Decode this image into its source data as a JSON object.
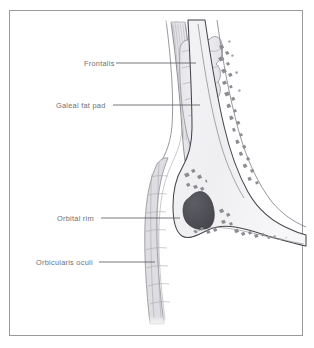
{
  "figure": {
    "kind": "anatomical-illustration",
    "view": "sagittal cross-section of brow and orbital rim",
    "border_color": "#9a9a9e",
    "background_color": "#ffffff"
  },
  "labels": [
    {
      "id": "frontalis",
      "text": "Frontalis",
      "leader": {
        "x1": 116,
        "y1": 63,
        "x2": 196,
        "y2": 63
      }
    },
    {
      "id": "galeal-fat-pad",
      "text": "Galeal fat pad",
      "leader": {
        "x1": 113,
        "y1": 105,
        "x2": 200,
        "y2": 105
      }
    },
    {
      "id": "orbital-rim",
      "text": "Orbital rim",
      "leader": {
        "x1": 101,
        "y1": 218,
        "x2": 180,
        "y2": 218
      }
    },
    {
      "id": "orbicularis-oculi",
      "text": "Orbicularis oculi",
      "leader": {
        "x1": 99,
        "y1": 262,
        "x2": 155,
        "y2": 262
      }
    }
  ],
  "structures": {
    "frontalis_muscle": {
      "name": "Frontalis",
      "fill": "#e9e9ec",
      "striation_color": "#b5b5bb"
    },
    "galeal_fat_pad": {
      "name": "Galeal fat pad",
      "fill": "#ededf0",
      "outline": "#8e8e95"
    },
    "orbicularis_oculi": {
      "name": "Orbicularis oculi",
      "fill": "#dcdce0",
      "outline": "#8e8e95"
    },
    "frontal_bone": {
      "name": "Frontal bone",
      "fill": "#f2f2f4",
      "outline": "#45454b",
      "trabecula_color": "#8a8a90"
    },
    "sinus_cavity": {
      "name": "Frontal sinus",
      "fill": "#4e4e55"
    },
    "skin_contour": {
      "name": "Skin",
      "outline": "#6e6e75"
    }
  },
  "palette": {
    "line_dark": "#45454b",
    "line_mid": "#7d7d84",
    "line_light": "#b5b5bb",
    "tissue_light": "#f2f2f4",
    "tissue_mid": "#e4e4e8",
    "cavity": "#4e4e55",
    "label_text": "#6f6f74"
  }
}
